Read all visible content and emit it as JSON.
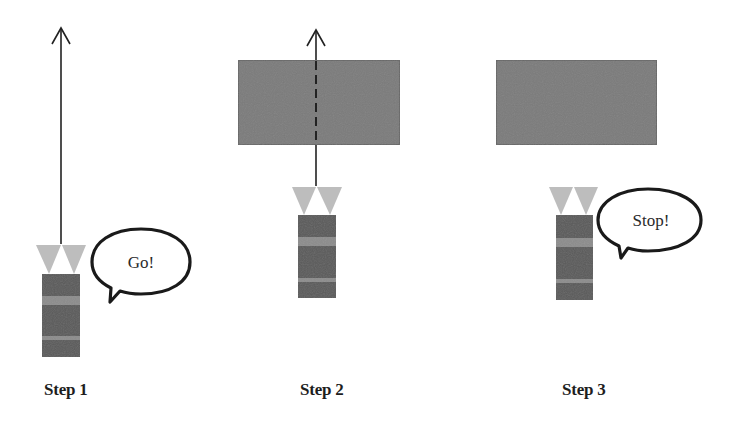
{
  "diagram": {
    "colors": {
      "background": "#ffffff",
      "robot_body": "#5a5a5a",
      "robot_band": "#8c8c8c",
      "sensor": "#bdbdbd",
      "obstacle_fill": "#7a7a7a",
      "obstacle_border": "#666666",
      "line": "#222222",
      "bubble_stroke": "#1a1a1a"
    },
    "steps": [
      {
        "label": "Step 1",
        "bubble_text": "Go!",
        "has_obstacle": false,
        "path_style": "solid arrow"
      },
      {
        "label": "Step 2",
        "bubble_text": "",
        "has_obstacle": true,
        "path_style": "arrow dashed through obstacle"
      },
      {
        "label": "Step 3",
        "bubble_text": "Stop!",
        "has_obstacle": true,
        "path_style": "none"
      }
    ]
  }
}
